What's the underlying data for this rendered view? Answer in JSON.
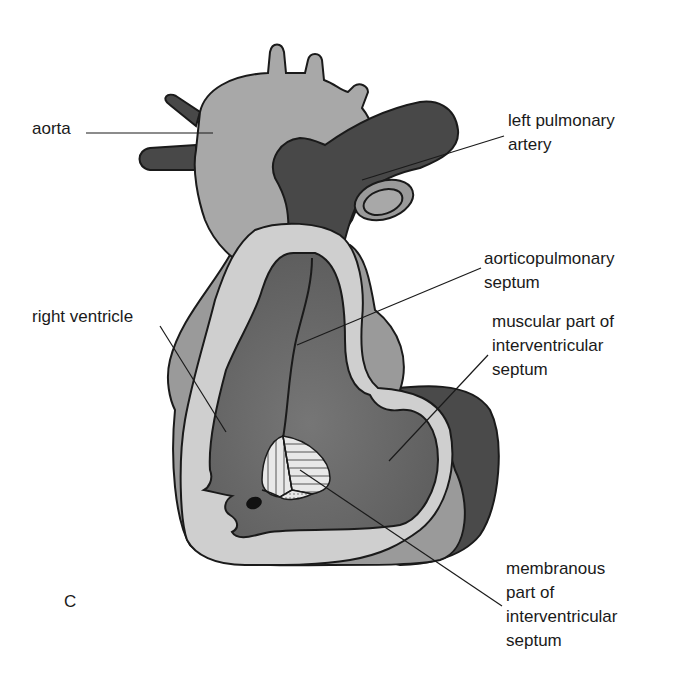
{
  "figure": {
    "panel_letter": "C",
    "colors": {
      "background": "#ffffff",
      "outline": "#1a1a1a",
      "aorta_fill": "#a8a8a8",
      "pulmonary_fill": "#484848",
      "outer_wall_fill": "#9a9a9a",
      "inner_wall_fill": "#cfcfcf",
      "ventricle_cavity_fill": "#6e6e6e",
      "left_ventricle_outer_fill": "#4a4a4a",
      "membranous_fill": "#e6e6e6"
    }
  },
  "labels": {
    "aorta": {
      "lines": [
        "aorta"
      ]
    },
    "left_pulmonary_artery": {
      "lines": [
        "left pulmonary",
        "artery"
      ]
    },
    "aorticopulmonary_septum": {
      "lines": [
        "aorticopulmonary",
        "septum"
      ]
    },
    "right_ventricle": {
      "lines": [
        "right ventricle"
      ]
    },
    "muscular_part": {
      "lines": [
        "muscular part of",
        "interventricular",
        "septum"
      ]
    },
    "membranous_part": {
      "lines": [
        "membranous",
        "part of",
        "interventricular",
        "septum"
      ]
    }
  }
}
